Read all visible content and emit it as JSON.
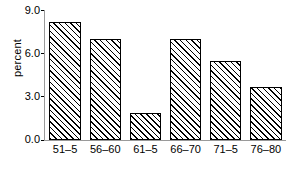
{
  "chart_data": {
    "type": "bar",
    "title": "",
    "subtitle": "",
    "xlabel": "",
    "ylabel": "percent",
    "categories": [
      "51–5",
      "56–60",
      "61–5",
      "66–70",
      "71–5",
      "76–80"
    ],
    "values": [
      8.2,
      7.0,
      1.9,
      7.0,
      5.5,
      3.7
    ],
    "ylim": [
      0.0,
      9.0
    ],
    "yticks": [
      "0.0",
      "3.0",
      "6.0",
      "9.0"
    ],
    "ytick_values": [
      0.0,
      3.0,
      6.0,
      9.0
    ],
    "grid": false,
    "legend": false,
    "legend_position": "none",
    "bar_style": {
      "fill": "#ffffff",
      "hatch": "diagonal-forward-slash",
      "hatch_color": "#000000",
      "edge_color": "#000000"
    },
    "axis_color": "#9a9a9a",
    "text_color": "#000000",
    "background": "#ffffff"
  }
}
